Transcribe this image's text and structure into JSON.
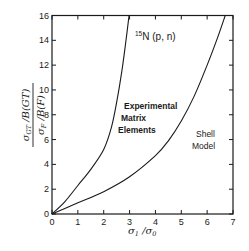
{
  "chart_data": {
    "type": "line",
    "title": "15N (p, n)",
    "title_superscript": "15",
    "title_main": "N (p, n)",
    "xlabel": "σ1 / σ0",
    "ylabel_numerator": "σGT / B(GT)",
    "ylabel_denominator": "σF / B(F)",
    "xlim": [
      0,
      7
    ],
    "ylim": [
      0,
      16
    ],
    "xticks": [
      "0",
      "1",
      "2",
      "3",
      "4",
      "5",
      "6",
      "7"
    ],
    "yticks": [
      "0",
      "2",
      "4",
      "6",
      "8",
      "10",
      "12",
      "14",
      "16"
    ],
    "grid": false,
    "series": [
      {
        "name": "Experimental Matrix Elements",
        "label_lines": [
          "Experimental",
          "Matrix",
          "Elements"
        ],
        "x": [
          0,
          0.5,
          1.0,
          1.5,
          2.0,
          2.3,
          2.5,
          2.7,
          2.85,
          2.98
        ],
        "y": [
          0,
          1.0,
          2.3,
          3.6,
          5.2,
          7.0,
          9.0,
          11.5,
          13.8,
          16
        ]
      },
      {
        "name": "Shell Model",
        "label_lines": [
          "Shell",
          "Model"
        ],
        "x": [
          0,
          1.0,
          2.0,
          3.0,
          4.0,
          4.5,
          5.0,
          5.5,
          6.0,
          6.4,
          6.7
        ],
        "y": [
          0,
          0.9,
          1.8,
          3.0,
          4.7,
          5.9,
          7.5,
          9.5,
          12.0,
          14.2,
          16
        ]
      }
    ]
  }
}
